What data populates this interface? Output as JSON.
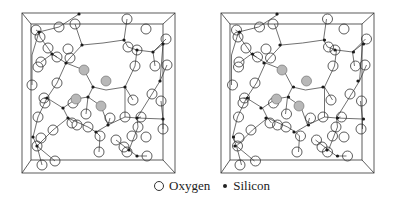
{
  "figure": {
    "panels": [
      {
        "id": "left",
        "offset_x": 0,
        "stereo_factor": 0
      },
      {
        "id": "right",
        "offset_x": 199,
        "stereo_factor": 1
      }
    ],
    "frame": {
      "outer": [
        22,
        13,
        175,
        173
      ],
      "inner": [
        31,
        24,
        163,
        160
      ]
    },
    "colors": {
      "line": "#333333",
      "oxygen_stroke": "#333333",
      "oxygen_fill": "#ffffff",
      "oxygen_shaded_fill": "#b8b8b8",
      "silicon_fill": "#1a1a1a"
    },
    "oxygen_radius": 5,
    "silicon_radius": 1.6,
    "silicon": [
      [
        79,
        14,
        0
      ],
      [
        39,
        32,
        1
      ],
      [
        82,
        45,
        0
      ],
      [
        124,
        40,
        1
      ],
      [
        137,
        50,
        0
      ],
      [
        163,
        44,
        1
      ],
      [
        52,
        54,
        1
      ],
      [
        66,
        63,
        0
      ],
      [
        153,
        52,
        1
      ],
      [
        160,
        81,
        0
      ],
      [
        93,
        87,
        1
      ],
      [
        125,
        87,
        0
      ],
      [
        47,
        98,
        1
      ],
      [
        63,
        108,
        0
      ],
      [
        88,
        97,
        1
      ],
      [
        68,
        118,
        0
      ],
      [
        108,
        125,
        1
      ],
      [
        96,
        132,
        0
      ],
      [
        163,
        119,
        1
      ],
      [
        33,
        137,
        1
      ],
      [
        37,
        146,
        0
      ],
      [
        137,
        118,
        1
      ],
      [
        129,
        150,
        0
      ],
      [
        137,
        156,
        1
      ]
    ],
    "oxygen": [
      [
        36,
        30,
        1
      ],
      [
        40,
        37,
        0
      ],
      [
        59,
        27,
        1
      ],
      [
        75,
        24,
        0
      ],
      [
        127,
        19,
        1
      ],
      [
        146,
        29,
        0
      ],
      [
        128,
        47,
        1
      ],
      [
        137,
        50,
        0
      ],
      [
        166,
        39,
        1
      ],
      [
        41,
        62,
        0
      ],
      [
        38,
        67,
        1
      ],
      [
        48,
        48,
        0
      ],
      [
        57,
        57,
        1
      ],
      [
        68,
        49,
        0
      ],
      [
        70,
        58,
        1
      ],
      [
        152,
        94,
        0
      ],
      [
        161,
        101,
        1
      ],
      [
        135,
        66,
        0
      ],
      [
        155,
        66,
        1
      ],
      [
        167,
        65,
        0
      ],
      [
        32,
        85,
        1
      ],
      [
        57,
        83,
        0
      ],
      [
        44,
        98,
        1
      ],
      [
        45,
        103,
        0
      ],
      [
        73,
        103,
        1
      ],
      [
        133,
        100,
        0
      ],
      [
        38,
        117,
        1
      ],
      [
        53,
        130,
        0
      ],
      [
        77,
        125,
        1
      ],
      [
        88,
        127,
        0
      ],
      [
        86,
        114,
        1
      ],
      [
        125,
        117,
        0
      ],
      [
        141,
        117,
        1
      ],
      [
        163,
        129,
        0
      ],
      [
        37,
        146,
        1
      ],
      [
        41,
        138,
        0
      ],
      [
        100,
        136,
        1
      ],
      [
        99,
        152,
        0
      ],
      [
        116,
        140,
        1
      ],
      [
        124,
        147,
        0
      ],
      [
        132,
        136,
        1
      ],
      [
        146,
        137,
        0
      ],
      [
        147,
        156,
        1
      ],
      [
        42,
        165,
        0
      ],
      [
        55,
        161,
        1
      ],
      [
        72,
        123,
        0
      ],
      [
        110,
        118,
        1
      ],
      [
        138,
        127,
        0
      ],
      [
        127,
        152,
        1
      ]
    ],
    "oxygen_shaded": [
      [
        84,
        70,
        0
      ],
      [
        106,
        81,
        1
      ],
      [
        101,
        106,
        0
      ],
      [
        76,
        99,
        1
      ]
    ],
    "bonds": [
      [
        79,
        14,
        59,
        27
      ],
      [
        59,
        27,
        39,
        32
      ],
      [
        39,
        32,
        36,
        30
      ],
      [
        39,
        32,
        40,
        37
      ],
      [
        39,
        32,
        32,
        55
      ],
      [
        32,
        55,
        32,
        85
      ],
      [
        40,
        37,
        48,
        48
      ],
      [
        48,
        48,
        52,
        54
      ],
      [
        52,
        54,
        57,
        57
      ],
      [
        52,
        54,
        41,
        62
      ],
      [
        52,
        54,
        66,
        63
      ],
      [
        66,
        63,
        70,
        58
      ],
      [
        70,
        58,
        82,
        45
      ],
      [
        82,
        45,
        75,
        24
      ],
      [
        82,
        45,
        103,
        43
      ],
      [
        103,
        43,
        124,
        40
      ],
      [
        124,
        40,
        127,
        19
      ],
      [
        124,
        40,
        128,
        47
      ],
      [
        128,
        47,
        137,
        50
      ],
      [
        137,
        50,
        153,
        52
      ],
      [
        153,
        52,
        166,
        39
      ],
      [
        153,
        52,
        163,
        44
      ],
      [
        163,
        44,
        160,
        81
      ],
      [
        160,
        81,
        152,
        94
      ],
      [
        160,
        81,
        167,
        65
      ],
      [
        153,
        52,
        155,
        66
      ],
      [
        137,
        50,
        135,
        66
      ],
      [
        135,
        66,
        125,
        87
      ],
      [
        125,
        87,
        106,
        90
      ],
      [
        106,
        90,
        93,
        87
      ],
      [
        93,
        87,
        84,
        70
      ],
      [
        84,
        70,
        66,
        63
      ],
      [
        66,
        63,
        57,
        83
      ],
      [
        57,
        83,
        47,
        98
      ],
      [
        47,
        98,
        44,
        98
      ],
      [
        47,
        98,
        63,
        108
      ],
      [
        63,
        108,
        76,
        99
      ],
      [
        76,
        99,
        88,
        97
      ],
      [
        88,
        97,
        93,
        87
      ],
      [
        88,
        97,
        101,
        106
      ],
      [
        101,
        106,
        108,
        125
      ],
      [
        88,
        97,
        86,
        114
      ],
      [
        63,
        108,
        68,
        118
      ],
      [
        68,
        118,
        72,
        123
      ],
      [
        68,
        118,
        53,
        130
      ],
      [
        53,
        130,
        37,
        146
      ],
      [
        37,
        146,
        33,
        137
      ],
      [
        33,
        137,
        38,
        117
      ],
      [
        38,
        117,
        47,
        98
      ],
      [
        37,
        146,
        42,
        165
      ],
      [
        37,
        146,
        55,
        161
      ],
      [
        68,
        118,
        88,
        127
      ],
      [
        88,
        127,
        96,
        132
      ],
      [
        96,
        132,
        100,
        136
      ],
      [
        100,
        136,
        99,
        152
      ],
      [
        96,
        132,
        108,
        125
      ],
      [
        108,
        125,
        125,
        117
      ],
      [
        125,
        117,
        137,
        118
      ],
      [
        137,
        118,
        141,
        117
      ],
      [
        137,
        118,
        152,
        94
      ],
      [
        125,
        117,
        125,
        87
      ],
      [
        137,
        118,
        163,
        119
      ],
      [
        163,
        119,
        163,
        129
      ],
      [
        163,
        119,
        161,
        101
      ],
      [
        129,
        150,
        116,
        140
      ],
      [
        129,
        150,
        137,
        156
      ],
      [
        137,
        156,
        147,
        156
      ],
      [
        129,
        150,
        138,
        127
      ],
      [
        138,
        127,
        137,
        118
      ],
      [
        108,
        125,
        110,
        118
      ],
      [
        125,
        87,
        133,
        100
      ]
    ]
  },
  "legend": {
    "oxygen_label": "Oxygen",
    "silicon_label": "Silicon"
  }
}
